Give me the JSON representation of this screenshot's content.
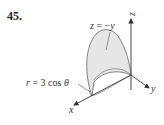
{
  "problem": {
    "number": "45."
  },
  "figure": {
    "surface_label": {
      "lhs": "z",
      "eq": " = −",
      "rhs": "y"
    },
    "curve_label": {
      "lhs": "r",
      "eq": " = 3 cos ",
      "theta": "θ"
    },
    "axes": {
      "x": "x",
      "y": "y",
      "z": "z"
    },
    "colors": {
      "surface_fill": "#e6e6e6",
      "stroke": "#555555",
      "axis": "#333333"
    }
  }
}
